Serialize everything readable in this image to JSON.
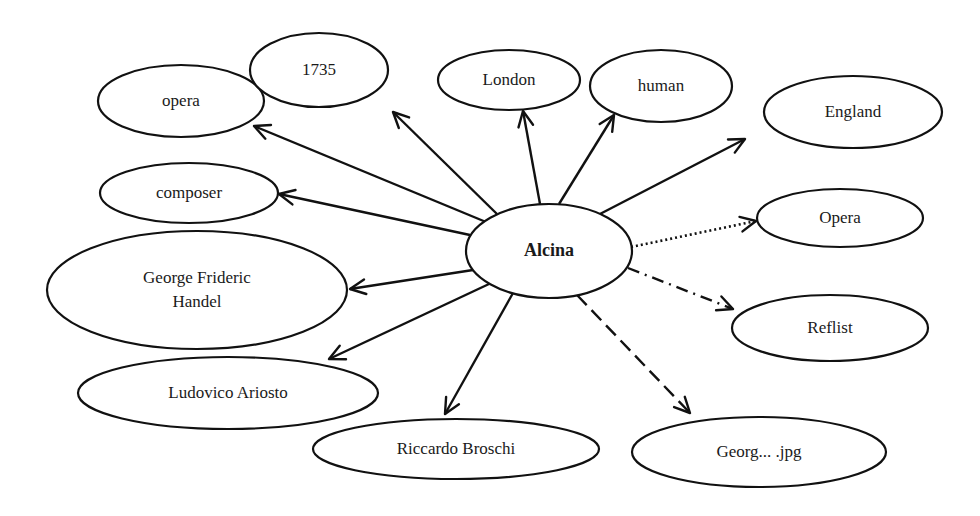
{
  "diagram": {
    "center": {
      "id": "alcina",
      "label": "Alcina",
      "cx": 549,
      "cy": 251,
      "rx": 83,
      "ry": 47
    },
    "nodes": [
      {
        "id": "opera-type",
        "label": "opera",
        "cx": 181,
        "cy": 101,
        "rx": 83,
        "ry": 36
      },
      {
        "id": "year",
        "label": "1735",
        "cx": 319,
        "cy": 70,
        "rx": 69,
        "ry": 37
      },
      {
        "id": "london",
        "label": "London",
        "cx": 509,
        "cy": 80,
        "rx": 71,
        "ry": 30
      },
      {
        "id": "human",
        "label": "human",
        "cx": 661,
        "cy": 86,
        "rx": 71,
        "ry": 36
      },
      {
        "id": "england",
        "label": "England",
        "cx": 853,
        "cy": 112,
        "rx": 89,
        "ry": 36
      },
      {
        "id": "composer",
        "label": "composer",
        "cx": 189,
        "cy": 193,
        "rx": 89,
        "ry": 30
      },
      {
        "id": "handel",
        "label": "George Frideric",
        "label2": "Handel",
        "cx": 197,
        "cy": 290,
        "rx": 150,
        "ry": 59
      },
      {
        "id": "opera-class",
        "label": "Opera",
        "cx": 840,
        "cy": 218,
        "rx": 83,
        "ry": 29
      },
      {
        "id": "reflist",
        "label": "Reflist",
        "cx": 830,
        "cy": 328,
        "rx": 98,
        "ry": 33
      },
      {
        "id": "ariosto",
        "label": "Ludovico Ariosto",
        "cx": 228,
        "cy": 393,
        "rx": 150,
        "ry": 36
      },
      {
        "id": "broschi",
        "label": "Riccardo Broschi",
        "cx": 456,
        "cy": 449,
        "rx": 143,
        "ry": 30
      },
      {
        "id": "image",
        "label": "Georg... .jpg",
        "cx": 759,
        "cy": 452,
        "rx": 127,
        "ry": 35
      }
    ],
    "edges": [
      {
        "to": "opera-type",
        "style": "solid",
        "x1": 486,
        "y1": 222,
        "x2": 254,
        "y2": 126
      },
      {
        "to": "year",
        "style": "solid",
        "x1": 497,
        "y1": 214,
        "x2": 393,
        "y2": 112
      },
      {
        "to": "london",
        "style": "solid",
        "x1": 540,
        "y1": 204,
        "x2": 523,
        "y2": 111
      },
      {
        "to": "human",
        "style": "solid",
        "x1": 559,
        "y1": 204,
        "x2": 614,
        "y2": 115
      },
      {
        "to": "england",
        "style": "solid",
        "x1": 598,
        "y1": 215,
        "x2": 745,
        "y2": 139
      },
      {
        "to": "composer",
        "style": "solid",
        "x1": 470,
        "y1": 235,
        "x2": 279,
        "y2": 194
      },
      {
        "to": "handel",
        "style": "solid",
        "x1": 473,
        "y1": 270,
        "x2": 350,
        "y2": 289
      },
      {
        "to": "opera-class",
        "style": "dotted",
        "x1": 631,
        "y1": 247,
        "x2": 756,
        "y2": 221
      },
      {
        "to": "reflist",
        "style": "dashdot",
        "x1": 628,
        "y1": 268,
        "x2": 733,
        "y2": 309
      },
      {
        "to": "ariosto",
        "style": "solid",
        "x1": 489,
        "y1": 284,
        "x2": 329,
        "y2": 359
      },
      {
        "to": "broschi",
        "style": "solid",
        "x1": 513,
        "y1": 293,
        "x2": 445,
        "y2": 414
      },
      {
        "to": "image",
        "style": "dashed",
        "x1": 577,
        "y1": 295,
        "x2": 690,
        "y2": 413
      }
    ]
  }
}
